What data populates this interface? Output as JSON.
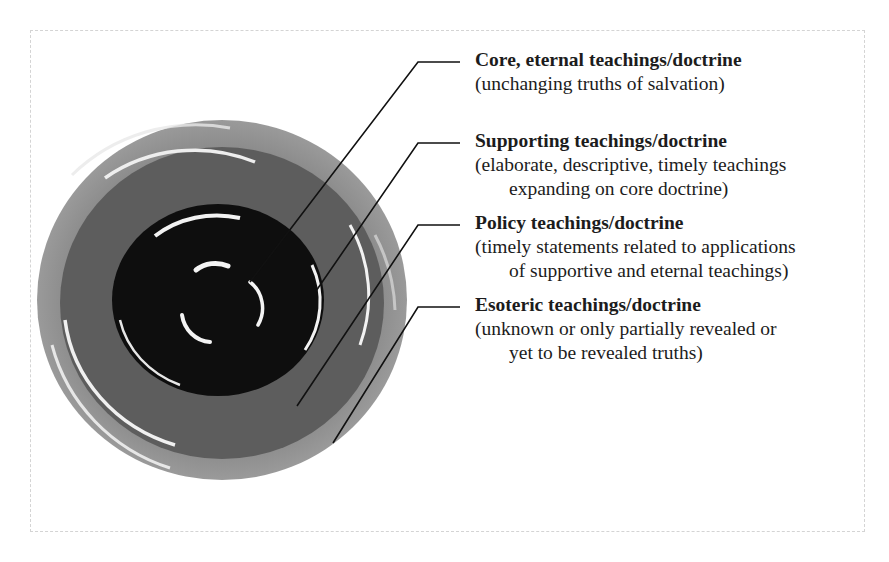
{
  "diagram": {
    "type": "concentric-rings",
    "colors": {
      "outer_ring": "#8a8a8a",
      "middle_ring": "#5c5c5c",
      "inner_disc": "#0e0e0e",
      "highlight": "#f2f2f2",
      "leader_line": "#111111",
      "text": "#1c1c1c"
    },
    "layers": [
      {
        "title": "Core, eternal teachings/doctrine",
        "desc_line1": "(unchanging truths of salvation)",
        "desc_line2": ""
      },
      {
        "title": "Supporting teachings/doctrine",
        "desc_line1": "(elaborate, descriptive, timely teachings",
        "desc_line2": "expanding on core doctrine)"
      },
      {
        "title": "Policy teachings/doctrine",
        "desc_line1": "(timely statements related to applications",
        "desc_line2": "of supportive and eternal teachings)"
      },
      {
        "title": "Esoteric teachings/doctrine",
        "desc_line1": "(unknown or only partially revealed or",
        "desc_line2": "yet to be revealed truths)"
      }
    ]
  }
}
